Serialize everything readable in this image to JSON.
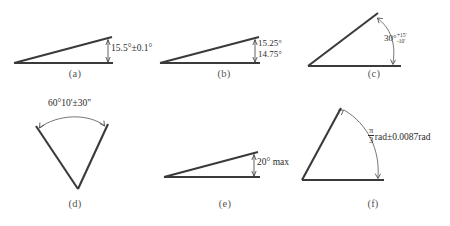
{
  "figure": {
    "ink_color": "#3a3a3a",
    "text_color": "#2b2b2b",
    "caption_color": "#555555",
    "background": "#ffffff"
  },
  "panels": [
    {
      "id": "a",
      "caption": "(a)",
      "notation_type": "symmetric-bilateral",
      "label": "15.5°±0.1°",
      "nominal": "15.5°",
      "tolerance": "±0.1°",
      "unit": "degree",
      "dimension_style": "vertical-double-arrow"
    },
    {
      "id": "b",
      "caption": "(b)",
      "notation_type": "limit-dimensions",
      "upper_limit": "15.25°",
      "lower_limit": "14.75°",
      "unit": "degree",
      "dimension_style": "vertical-double-arrow"
    },
    {
      "id": "c",
      "caption": "(c)",
      "notation_type": "unilateral-unequal",
      "nominal": "30°",
      "tolerance_upper": "+15'",
      "tolerance_lower": "-10'",
      "unit": "degree-minute",
      "dimension_style": "curved-arc"
    },
    {
      "id": "d",
      "caption": "(d)",
      "notation_type": "degree-minute-second",
      "label": "60°10'±30\"",
      "nominal": "60°10'",
      "tolerance": "±30\"",
      "unit": "degree-minute-second",
      "dimension_style": "curved-arc"
    },
    {
      "id": "e",
      "caption": "(e)",
      "notation_type": "maximum-limit",
      "label": "20° max",
      "nominal": "20°",
      "qualifier": "max",
      "unit": "degree",
      "dimension_style": "vertical-double-arrow"
    },
    {
      "id": "f",
      "caption": "(f)",
      "notation_type": "radian-bilateral",
      "nominal_numerator": "π",
      "nominal_denominator": "3",
      "nominal_suffix": "rad",
      "tolerance": "±0.0087rad",
      "unit": "radian",
      "dimension_style": "curved-arc"
    }
  ]
}
